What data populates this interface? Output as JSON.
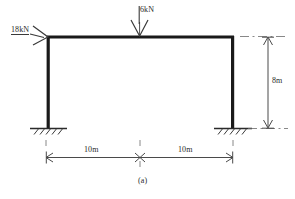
{
  "figure": {
    "caption": "(a)",
    "type": "portal-frame-structural-diagram"
  },
  "loads": {
    "horizontal": {
      "label": "18kN",
      "direction": "right",
      "applied_at": "top-left-joint"
    },
    "vertical": {
      "label": "6kN",
      "direction": "down",
      "applied_at": "beam-midspan"
    }
  },
  "dimensions": {
    "height": {
      "label": "8m",
      "orientation": "vertical",
      "side": "right"
    },
    "span_left": {
      "label": "10m",
      "orientation": "horizontal"
    },
    "span_right": {
      "label": "10m",
      "orientation": "horizontal"
    }
  },
  "supports": {
    "left": "fixed",
    "right": "fixed"
  },
  "colors": {
    "member": "#1a1a1a",
    "annotation": "#3a3a3a",
    "dimension": "#4a4a4a",
    "background": "#ffffff"
  }
}
